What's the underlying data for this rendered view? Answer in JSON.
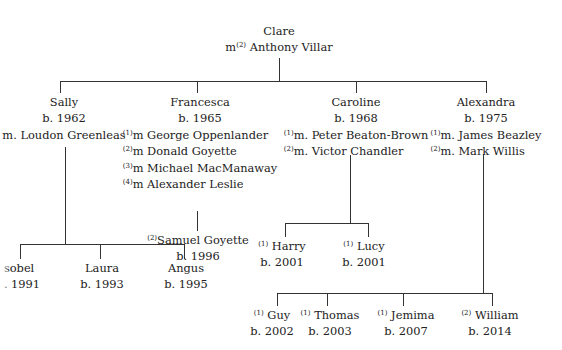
{
  "root": {
    "name": "Clare",
    "marriage_prefix": "m",
    "marriage_index": "(2)",
    "spouse": "Anthony Villar"
  },
  "children": [
    {
      "name": "Sally",
      "born": "b. 1962",
      "marriages": [
        {
          "index": "",
          "text": "m. Loudon Greenleas"
        }
      ],
      "children": [
        {
          "index": "",
          "name": "Isobel",
          "visible_name": "sobel",
          "born": "b. 1991",
          "visible_born": ". 1991"
        },
        {
          "index": "",
          "name": "Laura",
          "born": "b. 1993"
        },
        {
          "index": "",
          "name": "Angus",
          "born": "b. 1995"
        }
      ]
    },
    {
      "name": "Francesca",
      "born": "b. 1965",
      "marriages": [
        {
          "index": "(1)",
          "text": "m George Oppenlander"
        },
        {
          "index": "(2)",
          "text": "m Donald Goyette"
        },
        {
          "index": "(3)",
          "text": "m Michael MacManaway"
        },
        {
          "index": "(4)",
          "text": "m Alexander Leslie"
        }
      ],
      "children": [
        {
          "index": "(2)",
          "name": "Samuel Goyette",
          "born": "b. 1996"
        }
      ]
    },
    {
      "name": "Caroline",
      "born": "b. 1968",
      "marriages": [
        {
          "index": "(1)",
          "text": "m. Peter Beaton-Brown"
        },
        {
          "index": "(2)",
          "text": "m. Victor Chandler"
        }
      ],
      "children": [
        {
          "index": "(1)",
          "name": "Harry",
          "born": "b. 2001"
        },
        {
          "index": "(1)",
          "name": "Lucy",
          "born": "b. 2001"
        }
      ]
    },
    {
      "name": "Alexandra",
      "born": "b. 1975",
      "marriages": [
        {
          "index": "(1)",
          "text": "m. James Beazley"
        },
        {
          "index": "(2)",
          "text": "m. Mark Willis"
        }
      ],
      "children": [
        {
          "index": "(1)",
          "name": "Guy",
          "born": "b. 2002"
        },
        {
          "index": "(1)",
          "name": "Thomas",
          "born": "b. 2003"
        },
        {
          "index": "(1)",
          "name": "Jemima",
          "born": "b. 2007"
        },
        {
          "index": "(2)",
          "name": "William",
          "born": "b. 2014"
        }
      ]
    }
  ],
  "colors": {
    "line": "#333333",
    "text": "#222222",
    "background": "#ffffff"
  }
}
